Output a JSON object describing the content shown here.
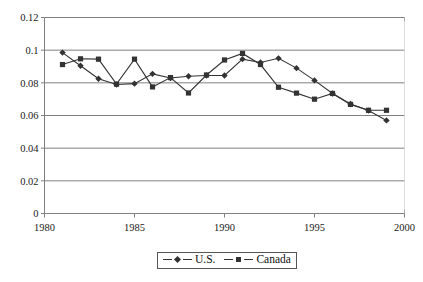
{
  "chart_data": {
    "type": "line",
    "title": "",
    "xlabel": "",
    "ylabel": "",
    "x": [
      1981,
      1982,
      1983,
      1984,
      1985,
      1986,
      1987,
      1988,
      1989,
      1990,
      1991,
      1992,
      1993,
      1994,
      1995,
      1996,
      1997,
      1998,
      1999
    ],
    "series": [
      {
        "name": "U.S.",
        "marker": "diamond",
        "values": [
          0.0985,
          0.0905,
          0.0825,
          0.079,
          0.0795,
          0.0855,
          0.083,
          0.084,
          0.0845,
          0.0845,
          0.0945,
          0.0925,
          0.095,
          0.089,
          0.0815,
          0.0735,
          0.067,
          0.063,
          0.057
        ]
      },
      {
        "name": "Canada",
        "marker": "square",
        "values": [
          0.0912,
          0.0947,
          0.0945,
          0.0792,
          0.0945,
          0.0775,
          0.0832,
          0.0738,
          0.0848,
          0.094,
          0.098,
          0.0912,
          0.0773,
          0.0737,
          0.07,
          0.0735,
          0.0668,
          0.0632,
          0.0632
        ]
      }
    ],
    "xlim": [
      1980,
      2000
    ],
    "ylim": [
      0,
      0.12
    ],
    "xticks": [
      "1980",
      "1985",
      "1990",
      "1995",
      "2000"
    ],
    "xtick_values": [
      1980,
      1985,
      1990,
      1995,
      2000
    ],
    "yticks": [
      "0",
      "0.02",
      "0.04",
      "0.06",
      "0.08",
      "0.1",
      "0.12"
    ],
    "ytick_values": [
      0,
      0.02,
      0.04,
      0.06,
      0.08,
      0.1,
      0.12
    ],
    "grid": "horizontal",
    "legend_position": "bottom-center",
    "colors": {
      "series_line": "#333333",
      "grid": "#808080",
      "axis": "#808080",
      "background": "#ffffff"
    }
  },
  "legend": {
    "entries": [
      {
        "label": "U.S.",
        "marker": "diamond-marker"
      },
      {
        "label": "Canada",
        "marker": "square-marker"
      }
    ]
  }
}
